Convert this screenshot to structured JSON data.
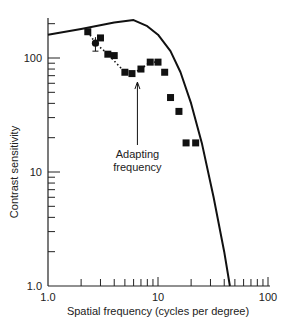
{
  "chart_data": {
    "type": "line",
    "title": "",
    "xlabel": "Spatial frequency (cycles per degree)",
    "ylabel": "Contrast sensitivity",
    "xscale": "log",
    "yscale": "log",
    "xlim": [
      1.0,
      100
    ],
    "ylim": [
      1.0,
      250
    ],
    "x_tick_labels": [
      "1.0",
      "10",
      "100"
    ],
    "y_tick_labels": [
      "1.0",
      "10",
      "100"
    ],
    "grid": false,
    "legend": null,
    "annotations": [
      {
        "text": "Adapting frequency",
        "x": 6.5,
        "arrow_to_y": 80
      }
    ],
    "series": [
      {
        "name": "Unadapted CSF",
        "style": "solid line",
        "x": [
          1.0,
          2.0,
          4.0,
          6.0,
          8.0,
          10.0,
          13.0,
          16.0,
          20.0,
          25.0,
          32.0,
          40.0,
          45.0
        ],
        "y": [
          160,
          180,
          205,
          215,
          190,
          160,
          115,
          75,
          40,
          18,
          6,
          2,
          1
        ]
      },
      {
        "name": "Adapted data",
        "style": "markers with dotted line",
        "x": [
          2.3,
          2.7,
          3.0,
          3.5,
          4.0,
          5.0,
          5.8,
          7.0,
          8.5,
          10.0,
          11.5,
          13.0,
          15.5,
          18.0,
          22.0
        ],
        "y": [
          170,
          135,
          150,
          108,
          105,
          75,
          73,
          80,
          92,
          92,
          75,
          45,
          34,
          18,
          18
        ]
      }
    ]
  }
}
